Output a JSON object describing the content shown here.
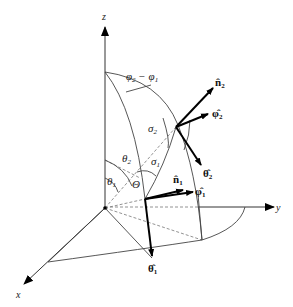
{
  "diagram": {
    "axes": {
      "x": "x",
      "y": "y",
      "z": "z"
    },
    "angle_labels": {
      "phi_diff": "φ₂ − φ₁",
      "phi2": "φ",
      "phi2_sub": "2",
      "minus": " − ",
      "phi1": "φ",
      "phi1_sub": "1",
      "theta1": "θ",
      "theta1_sub": "1",
      "theta2": "θ",
      "theta2_sub": "2",
      "Theta": "Θ",
      "sigma1": "σ",
      "sigma1_sub": "1",
      "sigma2": "σ",
      "sigma2_sub": "2"
    },
    "vectors": {
      "n2": {
        "base": "n̂",
        "sub": "2"
      },
      "phi2": {
        "base": "φ̂",
        "sub": "2"
      },
      "theta2": {
        "base": "θ̂",
        "sub": "2"
      },
      "n1": {
        "base": "n̂",
        "sub": "1"
      },
      "phi1": {
        "base": "φ̂",
        "sub": "1"
      },
      "theta1": {
        "base": "θ̂",
        "sub": "1"
      }
    },
    "colors": {
      "line": "#444444",
      "vector": "#000000",
      "dashed": "#777777"
    }
  }
}
